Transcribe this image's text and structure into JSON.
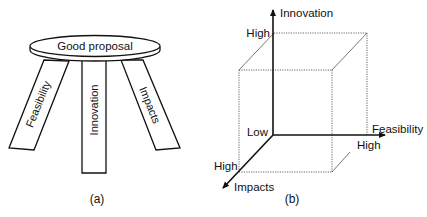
{
  "panel_a": {
    "caption": "(a)",
    "seat_label": "Good proposal",
    "legs": [
      {
        "label": "Feasibility"
      },
      {
        "label": "Innovation"
      },
      {
        "label": "Impacts"
      }
    ]
  },
  "panel_b": {
    "caption": "(b)",
    "axes": {
      "vertical": {
        "label": "Innovation",
        "high_label": "High"
      },
      "horizontal": {
        "label": "Feasibility",
        "high_label": "High"
      },
      "depth": {
        "label": "Impacts",
        "high_label": "High"
      }
    },
    "origin_label": "Low"
  },
  "colors": {
    "line": "#111111",
    "dotted": "#444444",
    "background": "#ffffff"
  }
}
